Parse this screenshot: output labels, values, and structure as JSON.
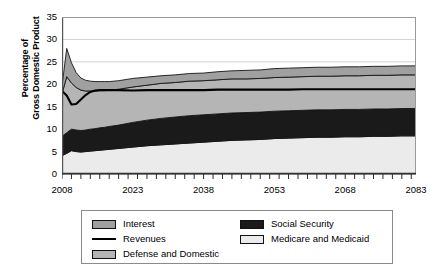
{
  "chart_data": {
    "type": "area",
    "title": "",
    "xlabel": "",
    "ylabel": "Percentage of Gross Domestic Product",
    "ylabel_line1": "Percentage of",
    "ylabel_line2": "Gross Domestic Product",
    "xlim": [
      2008,
      2083
    ],
    "ylim": [
      0,
      35
    ],
    "ytick_step": 5,
    "yticks": [
      "0",
      "5",
      "10",
      "15",
      "20",
      "25",
      "30",
      "35"
    ],
    "xticks": [
      "2008",
      "2023",
      "2038",
      "2053",
      "2068",
      "2083"
    ],
    "xtick_step": 15,
    "minor_tick_step": 2,
    "grid": "horizontal",
    "legend_position": "bottom",
    "stacked": true,
    "x": [
      2008,
      2009,
      2010,
      2011,
      2012,
      2013,
      2014,
      2015,
      2016,
      2017,
      2018,
      2020,
      2023,
      2026,
      2029,
      2032,
      2035,
      2038,
      2041,
      2044,
      2047,
      2050,
      2053,
      2056,
      2059,
      2062,
      2065,
      2068,
      2071,
      2074,
      2077,
      2080,
      2083
    ],
    "series": [
      {
        "name": "Medicare and Medicaid",
        "color": "#ebebeb",
        "stack_order": 1,
        "values": [
          4.1,
          4.6,
          5.2,
          5.0,
          4.9,
          5.0,
          5.1,
          5.2,
          5.3,
          5.4,
          5.5,
          5.7,
          6.0,
          6.3,
          6.5,
          6.7,
          6.9,
          7.1,
          7.3,
          7.5,
          7.6,
          7.7,
          7.9,
          8.0,
          8.1,
          8.2,
          8.2,
          8.3,
          8.3,
          8.4,
          8.4,
          8.5,
          8.5
        ]
      },
      {
        "name": "Social Security",
        "color": "#1a1a1a",
        "stack_order": 2,
        "values": [
          4.3,
          4.6,
          4.8,
          4.8,
          4.8,
          4.8,
          4.9,
          4.9,
          5.0,
          5.0,
          5.1,
          5.2,
          5.5,
          5.7,
          5.9,
          6.0,
          6.1,
          6.1,
          6.1,
          6.1,
          6.1,
          6.1,
          6.1,
          6.1,
          6.1,
          6.1,
          6.1,
          6.1,
          6.1,
          6.1,
          6.1,
          6.1,
          6.1
        ]
      },
      {
        "name": "Defense and Domestic",
        "color": "#b5b5b5",
        "stack_order": 3,
        "values": [
          9.5,
          12.5,
          10.3,
          9.5,
          9.0,
          8.7,
          8.5,
          8.4,
          8.3,
          8.2,
          8.1,
          8.0,
          7.9,
          7.8,
          7.8,
          7.7,
          7.7,
          7.6,
          7.6,
          7.6,
          7.5,
          7.5,
          7.5,
          7.5,
          7.5,
          7.5,
          7.5,
          7.5,
          7.5,
          7.5,
          7.5,
          7.5,
          7.5
        ]
      },
      {
        "name": "Interest",
        "color": "#a0a0a0",
        "stack_order": 4,
        "values": [
          1.7,
          6.3,
          4.5,
          3.3,
          2.7,
          2.4,
          2.2,
          2.1,
          2.0,
          2.0,
          1.9,
          1.9,
          1.9,
          1.8,
          1.7,
          1.7,
          1.7,
          1.7,
          1.8,
          1.8,
          1.9,
          1.9,
          2.0,
          2.0,
          2.0,
          2.0,
          2.0,
          2.0,
          2.0,
          2.0,
          2.0,
          2.0,
          2.0
        ]
      }
    ],
    "line_series": [
      {
        "name": "Revenues",
        "color": "#000000",
        "values": [
          18.5,
          17.5,
          15.5,
          15.6,
          16.6,
          17.6,
          18.3,
          18.6,
          18.7,
          18.7,
          18.7,
          18.7,
          18.6,
          18.7,
          18.7,
          18.7,
          18.7,
          18.7,
          18.8,
          18.8,
          18.8,
          18.8,
          18.8,
          18.8,
          18.9,
          18.9,
          18.9,
          18.9,
          18.9,
          18.9,
          18.9,
          18.9,
          18.9
        ]
      }
    ]
  },
  "legend": {
    "items": [
      {
        "label": "Interest",
        "swatch": "#a0a0a0",
        "type": "box",
        "col": 0,
        "row": 0
      },
      {
        "label": "Revenues",
        "swatch": "#000000",
        "type": "line",
        "col": 0,
        "row": 1
      },
      {
        "label": "Defense and Domestic",
        "swatch": "#b5b5b5",
        "type": "box",
        "col": 0,
        "row": 2
      },
      {
        "label": "Social Security",
        "swatch": "#1a1a1a",
        "type": "box",
        "col": 1,
        "row": 0
      },
      {
        "label": "Medicare and Medicaid",
        "swatch": "#ebebeb",
        "type": "box",
        "col": 1,
        "row": 1
      }
    ]
  }
}
